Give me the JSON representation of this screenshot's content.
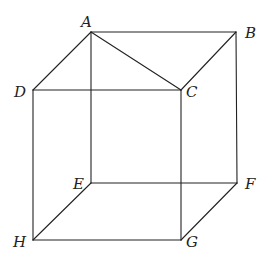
{
  "figure": {
    "type": "cube-wireframe",
    "width": 269,
    "height": 262,
    "line_color": "#222222",
    "vertices": {
      "A": {
        "x": 91,
        "y": 32
      },
      "B": {
        "x": 236,
        "y": 32
      },
      "C": {
        "x": 181,
        "y": 90
      },
      "D": {
        "x": 33,
        "y": 90
      },
      "E": {
        "x": 91,
        "y": 183
      },
      "F": {
        "x": 237,
        "y": 183
      },
      "G": {
        "x": 181,
        "y": 240
      },
      "H": {
        "x": 33,
        "y": 240
      }
    },
    "labels": [
      {
        "id": "A",
        "text": "A",
        "x": 81,
        "y": 27
      },
      {
        "id": "B",
        "text": "B",
        "x": 245,
        "y": 38
      },
      {
        "id": "C",
        "text": "C",
        "x": 186,
        "y": 97
      },
      {
        "id": "D",
        "text": "D",
        "x": 14,
        "y": 97
      },
      {
        "id": "E",
        "text": "E",
        "x": 73,
        "y": 189
      },
      {
        "id": "F",
        "text": "F",
        "x": 245,
        "y": 189
      },
      {
        "id": "G",
        "text": "G",
        "x": 186,
        "y": 247
      },
      {
        "id": "H",
        "text": "H",
        "x": 13,
        "y": 247
      }
    ],
    "edges": [
      [
        "A",
        "B"
      ],
      [
        "A",
        "D"
      ],
      [
        "A",
        "C"
      ],
      [
        "A",
        "E"
      ],
      [
        "B",
        "C"
      ],
      [
        "B",
        "F"
      ],
      [
        "D",
        "C"
      ],
      [
        "D",
        "H"
      ],
      [
        "C",
        "G"
      ],
      [
        "E",
        "F"
      ],
      [
        "E",
        "H"
      ],
      [
        "F",
        "G"
      ],
      [
        "H",
        "G"
      ]
    ]
  }
}
